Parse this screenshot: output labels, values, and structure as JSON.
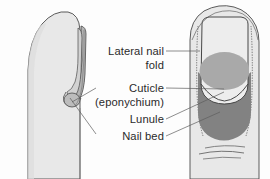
{
  "figure": {
    "type": "anatomical-diagram",
    "background_color": "#fdfdfd"
  },
  "labels": [
    {
      "id": "lateral-nail-fold",
      "line1": "Lateral nail",
      "line2": "fold"
    },
    {
      "id": "cuticle",
      "line1": "Cuticle",
      "line2": "(eponychium)"
    },
    {
      "id": "lunule",
      "line1": "Lunule"
    },
    {
      "id": "nail-bed",
      "line1": "Nail bed"
    }
  ],
  "colors": {
    "skin": "#e8e8e8",
    "skin_shadow": "#d8d8d8",
    "nail_plate": "#ededed",
    "lunule": "#a9a9a9",
    "nail_bed": "#828282",
    "outline": "#4a4a4a",
    "leader": "#5d5d5d",
    "text": "#2b2b2b"
  },
  "views": {
    "left": {
      "name": "lateral-profile-view",
      "description": "side profile of fingertip with nail edge"
    },
    "right": {
      "name": "dorsal-view",
      "description": "top view of fingertip showing nail plate, lunule and nail bed"
    }
  }
}
